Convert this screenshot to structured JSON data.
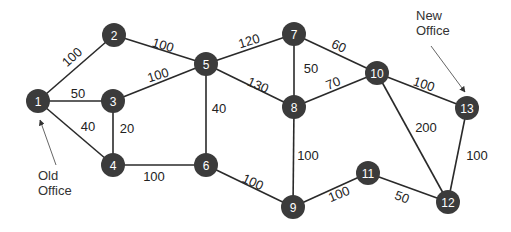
{
  "diagram": {
    "type": "weighted-undirected-graph",
    "node_color": "#3b3b3b",
    "node_text_color": "#ffffff",
    "nodes": [
      {
        "id": "1",
        "x": 38,
        "y": 101
      },
      {
        "id": "2",
        "x": 114,
        "y": 35
      },
      {
        "id": "3",
        "x": 113,
        "y": 101
      },
      {
        "id": "4",
        "x": 113,
        "y": 165
      },
      {
        "id": "5",
        "x": 206,
        "y": 64
      },
      {
        "id": "6",
        "x": 206,
        "y": 165
      },
      {
        "id": "7",
        "x": 294,
        "y": 34
      },
      {
        "id": "8",
        "x": 294,
        "y": 107
      },
      {
        "id": "9",
        "x": 293,
        "y": 207
      },
      {
        "id": "10",
        "x": 377,
        "y": 73
      },
      {
        "id": "11",
        "x": 368,
        "y": 173
      },
      {
        "id": "12",
        "x": 448,
        "y": 202
      },
      {
        "id": "13",
        "x": 467,
        "y": 108
      }
    ],
    "edges": [
      {
        "from": "1",
        "to": "2",
        "weight": "100",
        "lx": 72,
        "ly": 57,
        "rot": -42
      },
      {
        "from": "1",
        "to": "3",
        "weight": "50",
        "lx": 78,
        "ly": 93,
        "rot": 0
      },
      {
        "from": "1",
        "to": "4",
        "weight": "40",
        "lx": 88,
        "ly": 126,
        "rot": 0
      },
      {
        "from": "3",
        "to": "4",
        "weight": "20",
        "lx": 127,
        "ly": 128,
        "rot": 0
      },
      {
        "from": "2",
        "to": "5",
        "weight": "100",
        "lx": 163,
        "ly": 45,
        "rot": 17
      },
      {
        "from": "3",
        "to": "5",
        "weight": "100",
        "lx": 158,
        "ly": 75,
        "rot": -17
      },
      {
        "from": "4",
        "to": "6",
        "weight": "100",
        "lx": 154,
        "ly": 176,
        "rot": 0
      },
      {
        "from": "5",
        "to": "6",
        "weight": "40",
        "lx": 219,
        "ly": 108,
        "rot": 0
      },
      {
        "from": "5",
        "to": "7",
        "weight": "120",
        "lx": 249,
        "ly": 41,
        "rot": -17
      },
      {
        "from": "5",
        "to": "8",
        "weight": "130",
        "lx": 258,
        "ly": 85,
        "rot": 24
      },
      {
        "from": "7",
        "to": "8",
        "weight": "50",
        "lx": 311,
        "ly": 68,
        "rot": 0
      },
      {
        "from": "7",
        "to": "10",
        "weight": "60",
        "lx": 339,
        "ly": 46,
        "rot": 25
      },
      {
        "from": "8",
        "to": "10",
        "weight": "70",
        "lx": 333,
        "ly": 83,
        "rot": -22
      },
      {
        "from": "6",
        "to": "9",
        "weight": "100",
        "lx": 253,
        "ly": 182,
        "rot": 25
      },
      {
        "from": "8",
        "to": "9",
        "weight": "100",
        "lx": 308,
        "ly": 155,
        "rot": 0
      },
      {
        "from": "9",
        "to": "11",
        "weight": "100",
        "lx": 339,
        "ly": 194,
        "rot": -22
      },
      {
        "from": "10",
        "to": "13",
        "weight": "100",
        "lx": 424,
        "ly": 84,
        "rot": 18
      },
      {
        "from": "10",
        "to": "12",
        "weight": "200",
        "lx": 426,
        "ly": 127,
        "rot": 0
      },
      {
        "from": "11",
        "to": "12",
        "weight": "50",
        "lx": 402,
        "ly": 197,
        "rot": 20
      },
      {
        "from": "13",
        "to": "12",
        "weight": "100",
        "lx": 477,
        "ly": 155,
        "rot": 0
      }
    ],
    "annotations": [
      {
        "name": "old-office-label",
        "lines": [
          "Old",
          "Office"
        ],
        "x": 38,
        "y": 180,
        "arrow_from": [
          56,
          165
        ],
        "arrow_to": [
          40,
          120
        ]
      },
      {
        "name": "new-office-label",
        "lines": [
          "New",
          "Office"
        ],
        "x": 416,
        "y": 20,
        "arrow_from": [
          431,
          46
        ],
        "arrow_to": [
          465,
          92
        ]
      }
    ]
  }
}
